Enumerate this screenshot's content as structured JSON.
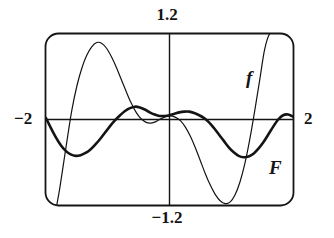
{
  "figure": {
    "kind": "graphing-calculator-viewport",
    "background_color": "#ffffff",
    "ink_color": "#141414"
  },
  "axis_labels": {
    "top": "1.2",
    "bottom": "−1.2",
    "left": "−2",
    "right": "2"
  },
  "curve_labels": {
    "f": "f",
    "F": "F"
  },
  "chart_data": {
    "type": "line",
    "title": "",
    "xlabel": "",
    "ylabel": "",
    "xlim": [
      -2,
      2
    ],
    "ylim": [
      -1.2,
      1.2
    ],
    "grid": false,
    "legend_position": "inline-curve-labels",
    "axis_tick_labels": {
      "x_min": "−2",
      "x_max": "2",
      "y_max": "1.2",
      "y_min": "−1.2"
    },
    "annotations": [
      {
        "text": "f",
        "x": 1.35,
        "y": 0.62,
        "style": "bold-italic"
      },
      {
        "text": "F",
        "x": 1.62,
        "y": -0.52,
        "style": "bold-italic"
      }
    ],
    "series": [
      {
        "name": "f",
        "style": "thin",
        "stroke_width": 1.2,
        "x": [
          -1.83,
          -1.78,
          -1.72,
          -1.65,
          -1.58,
          -1.5,
          -1.42,
          -1.34,
          -1.26,
          -1.18,
          -1.1,
          -1.02,
          -0.94,
          -0.86,
          -0.78,
          -0.7,
          -0.62,
          -0.54,
          -0.46,
          -0.38,
          -0.3,
          -0.22,
          -0.14,
          -0.06,
          0.02,
          0.1,
          0.18,
          0.26,
          0.34,
          0.42,
          0.5,
          0.58,
          0.66,
          0.74,
          0.82,
          0.9,
          0.98,
          1.06,
          1.14,
          1.22,
          1.3,
          1.38,
          1.46,
          1.54,
          1.62,
          1.7
        ],
        "y": [
          -1.22,
          -0.98,
          -0.64,
          -0.24,
          0.14,
          0.47,
          0.72,
          0.9,
          1.02,
          1.08,
          1.07,
          1.0,
          0.88,
          0.73,
          0.56,
          0.39,
          0.23,
          0.1,
          0.01,
          -0.04,
          -0.05,
          -0.03,
          0.01,
          0.04,
          0.05,
          0.03,
          -0.02,
          -0.11,
          -0.24,
          -0.4,
          -0.58,
          -0.76,
          -0.92,
          -1.05,
          -1.14,
          -1.18,
          -1.16,
          -1.06,
          -0.88,
          -0.62,
          -0.28,
          0.12,
          0.55,
          0.98,
          1.2,
          1.22
        ]
      },
      {
        "name": "F",
        "style": "bold",
        "stroke_width": 2.6,
        "x": [
          -2.0,
          -1.92,
          -1.84,
          -1.76,
          -1.68,
          -1.6,
          -1.52,
          -1.44,
          -1.36,
          -1.28,
          -1.2,
          -1.12,
          -1.04,
          -0.96,
          -0.88,
          -0.8,
          -0.72,
          -0.64,
          -0.56,
          -0.48,
          -0.4,
          -0.32,
          -0.24,
          -0.16,
          -0.08,
          0.0,
          0.08,
          0.16,
          0.24,
          0.32,
          0.4,
          0.48,
          0.56,
          0.64,
          0.72,
          0.8,
          0.88,
          0.96,
          1.04,
          1.12,
          1.2,
          1.28,
          1.36,
          1.44,
          1.52,
          1.6,
          1.68,
          1.76,
          1.84,
          1.92,
          2.0
        ],
        "y": [
          0.02,
          -0.12,
          -0.25,
          -0.36,
          -0.44,
          -0.49,
          -0.51,
          -0.5,
          -0.47,
          -0.42,
          -0.35,
          -0.27,
          -0.18,
          -0.09,
          -0.01,
          0.06,
          0.12,
          0.16,
          0.18,
          0.17,
          0.14,
          0.1,
          0.07,
          0.05,
          0.05,
          0.06,
          0.08,
          0.1,
          0.11,
          0.11,
          0.09,
          0.06,
          0.02,
          -0.04,
          -0.12,
          -0.21,
          -0.3,
          -0.39,
          -0.46,
          -0.51,
          -0.53,
          -0.52,
          -0.48,
          -0.41,
          -0.32,
          -0.21,
          -0.1,
          0.0,
          0.06,
          0.07,
          0.04
        ]
      }
    ]
  }
}
